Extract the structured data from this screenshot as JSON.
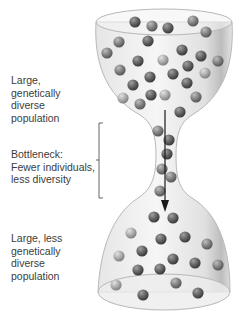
{
  "labels": {
    "top_population": "Large,\ngenetically\ndiverse\npopulation",
    "bottleneck": "Bottleneck:\nFewer individuals,\nless diversity",
    "bottom_population": "Large, less\ngenetically\ndiverse\npopulation"
  },
  "colors": {
    "glass_fill": "#e9e9e9",
    "glass_stroke": "#b8b8b8",
    "bead_dark": "#5f5f5f",
    "bead_mid": "#7d7d7d",
    "bead_light": "#a8a8a8",
    "arrow": "#1a1a1a",
    "text": "#3c3c3c"
  },
  "beads": {
    "top": [
      [
        135,
        22,
        "d"
      ],
      [
        152,
        26,
        "m"
      ],
      [
        168,
        28,
        "d"
      ],
      [
        193,
        21,
        "m"
      ],
      [
        206,
        32,
        "m"
      ],
      [
        119,
        42,
        "m"
      ],
      [
        148,
        41,
        "d"
      ],
      [
        107,
        53,
        "m"
      ],
      [
        138,
        61,
        "d"
      ],
      [
        163,
        60,
        "l"
      ],
      [
        182,
        50,
        "d"
      ],
      [
        201,
        56,
        "d"
      ],
      [
        218,
        61,
        "m"
      ],
      [
        120,
        70,
        "m"
      ],
      [
        150,
        77,
        "d"
      ],
      [
        173,
        74,
        "d"
      ],
      [
        188,
        66,
        "d"
      ],
      [
        205,
        73,
        "l"
      ],
      [
        133,
        85,
        "d"
      ],
      [
        187,
        83,
        "d"
      ],
      [
        165,
        95,
        "l"
      ],
      [
        123,
        98,
        "l"
      ],
      [
        140,
        104,
        "m"
      ],
      [
        151,
        95,
        "d"
      ],
      [
        196,
        97,
        "m"
      ],
      [
        180,
        112,
        "d"
      ]
    ],
    "neck": [
      [
        158,
        131,
        "m"
      ],
      [
        169,
        140,
        "d"
      ],
      [
        167,
        154,
        "d"
      ],
      [
        162,
        169,
        "m"
      ],
      [
        171,
        177,
        "m"
      ],
      [
        160,
        191,
        "m"
      ]
    ],
    "bottom": [
      [
        154,
        217,
        "d"
      ],
      [
        173,
        218,
        "d"
      ],
      [
        131,
        233,
        "l"
      ],
      [
        161,
        239,
        "d"
      ],
      [
        185,
        237,
        "d"
      ],
      [
        207,
        244,
        "m"
      ],
      [
        119,
        256,
        "l"
      ],
      [
        142,
        251,
        "d"
      ],
      [
        173,
        259,
        "d"
      ],
      [
        195,
        263,
        "d"
      ],
      [
        218,
        265,
        "m"
      ],
      [
        138,
        270,
        "d"
      ],
      [
        160,
        269,
        "d"
      ],
      [
        116,
        285,
        "l"
      ],
      [
        176,
        283,
        "m"
      ],
      [
        143,
        295,
        "d"
      ],
      [
        198,
        293,
        "d"
      ]
    ]
  }
}
